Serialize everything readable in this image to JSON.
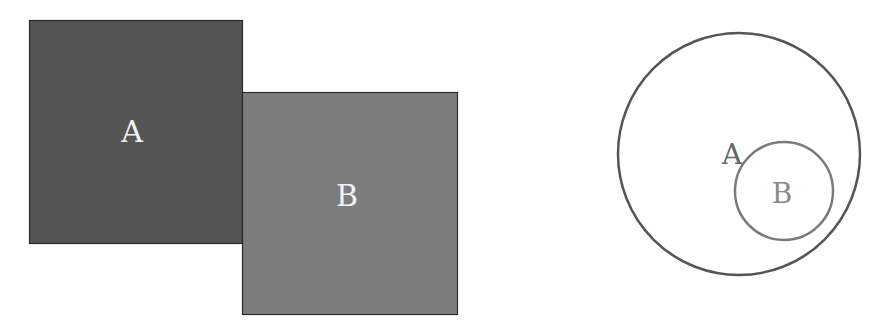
{
  "left_figure": {
    "description": "Two adjacent squares touching at a shared edge segment",
    "square_a": {
      "label": "A",
      "fill": "#555555",
      "stroke": "#2a2a2a",
      "label_color": "#f2f2f2"
    },
    "square_b": {
      "label": "B",
      "fill": "#7d7d7d",
      "stroke": "#2a2a2a",
      "label_color": "#f2f2f2"
    }
  },
  "right_figure": {
    "description": "Small circle B contained inside large circle A",
    "outer_circle": {
      "label": "A",
      "stroke": "#555555",
      "label_color": "#666666"
    },
    "inner_circle": {
      "label": "B",
      "stroke": "#7a7a7a",
      "label_color": "#8a8a8a"
    }
  }
}
